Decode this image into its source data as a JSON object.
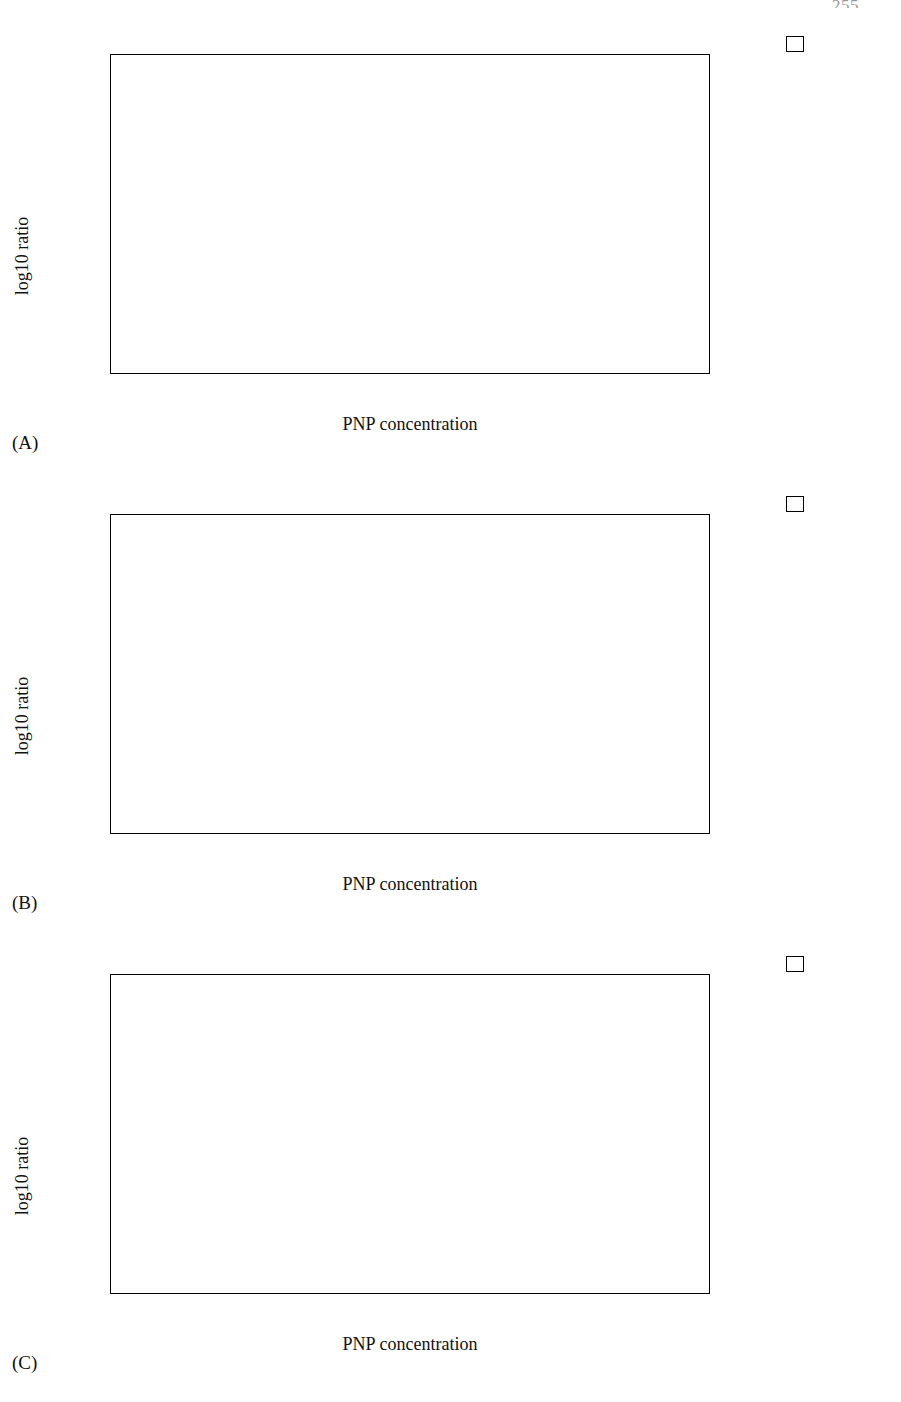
{
  "page": {
    "number": "255"
  },
  "figure": {
    "axis": {
      "y_label": "log10 ratio",
      "x_label": "PNP concentration",
      "y_ticks": [
        "0.00",
        "0.20",
        "0.40",
        "0.60",
        "0.80",
        "1.00",
        "1.20"
      ],
      "categories": [
        "Untreated",
        "10 mg/l",
        "32 mg/l",
        "56 mg/l"
      ]
    },
    "panels": [
      {
        "id": "A",
        "label": "(A)"
      },
      {
        "id": "B",
        "label": "(B)"
      },
      {
        "id": "C",
        "label": "(C)"
      }
    ]
  },
  "chart_data": [
    {
      "panel": "A",
      "type": "bar",
      "title": "",
      "xlabel": "PNP concentration",
      "ylabel": "log10 ratio",
      "ylim": [
        0.0,
        1.2
      ],
      "ytick_step": 0.2,
      "grid": false,
      "legend_position": "right-outside",
      "categories": [
        "Untreated",
        "10 mg/l",
        "32 mg/l",
        "56 mg/l"
      ],
      "series": [
        {
          "name": "rplY",
          "fill": "f-black",
          "values": [
            1.07,
            1.01,
            0.87,
            0.41
          ]
        },
        {
          "name": "rplD",
          "fill": "f-darkdot",
          "values": [
            1.02,
            1.04,
            0.81,
            0.51
          ]
        },
        {
          "name": "rplN",
          "fill": "f-dark",
          "values": [
            0.94,
            0.98,
            1.01,
            0.54
          ]
        },
        {
          "name": "rplB",
          "fill": "f-mid",
          "values": [
            0.87,
            0.99,
            0.84,
            0.51
          ]
        },
        {
          "name": "rplJ",
          "fill": "f-light",
          "values": [
            0.84,
            0.97,
            0.71,
            0.5
          ]
        },
        {
          "name": "rplX",
          "fill": "f-white",
          "values": [
            0.79,
            0.82,
            0.74,
            0.41
          ]
        },
        {
          "name": "rplC",
          "fill": "f-spdark",
          "values": [
            0.58,
            0.91,
            0.69,
            0.42
          ]
        },
        {
          "name": "rplF",
          "fill": "f-black",
          "values": [
            0.54,
            0.78,
            0.68,
            0.37
          ]
        },
        {
          "name": "rplS",
          "fill": "f-splight",
          "values": [
            0.42,
            0.52,
            0.51,
            0.24
          ]
        }
      ]
    },
    {
      "panel": "B",
      "type": "bar",
      "title": "",
      "xlabel": "PNP concentration",
      "ylabel": "log10 ratio",
      "ylim": [
        0.0,
        1.2
      ],
      "ytick_step": 0.2,
      "grid": false,
      "legend_position": "right-outside",
      "categories": [
        "Untreated",
        "10 mg/l",
        "32 mg/l",
        "56 mg/l"
      ],
      "series": [
        {
          "name": "rpsN",
          "fill": "f-white",
          "values": [
            1.03,
            1.01,
            0.83,
            0.59
          ]
        },
        {
          "name": "rpsJ",
          "fill": "f-light",
          "values": [
            0.83,
            0.92,
            0.76,
            0.54
          ]
        },
        {
          "name": "rpsB",
          "fill": "f-mid",
          "values": [
            0.79,
            0.79,
            0.84,
            0.44
          ]
        },
        {
          "name": "rpsS",
          "fill": "f-midlt",
          "values": [
            0.77,
            0.97,
            0.68,
            0.42
          ]
        },
        {
          "name": "rpsT",
          "fill": "f-dark",
          "values": [
            0.73,
            0.73,
            0.5,
            0.23
          ]
        },
        {
          "name": "rpsD",
          "fill": "f-black",
          "values": [
            0.4,
            0.56,
            0.505,
            0.235
          ]
        }
      ]
    },
    {
      "panel": "C",
      "type": "bar",
      "title": "",
      "xlabel": "PNP concentration",
      "ylabel": "log10 ratio",
      "ylim": [
        0.0,
        1.2
      ],
      "ytick_step": 0.2,
      "grid": false,
      "legend_position": "right-outside",
      "categories": [
        "Untreated",
        "10 mg/l",
        "32 mg/l",
        "56 mg/l"
      ],
      "series": [
        {
          "name": "rpmB",
          "fill": "f-dark",
          "values": [
            0.9,
            0.77,
            0.61,
            0.325
          ]
        },
        {
          "name": "rpmG",
          "fill": "f-midlt",
          "values": [
            0.55,
            0.71,
            0.38,
            0.34
          ]
        },
        {
          "name": "infA",
          "fill": "f-mid",
          "values": [
            0.82,
            0.815,
            0.7,
            0.4
          ]
        },
        {
          "name": "slyD",
          "fill": "f-light",
          "values": [
            0.7,
            0.86,
            0.82,
            0.515
          ]
        },
        {
          "name": "prfB",
          "fill": "f-white",
          "values": [
            0.48,
            0.655,
            0.62,
            0.31
          ]
        }
      ]
    }
  ]
}
